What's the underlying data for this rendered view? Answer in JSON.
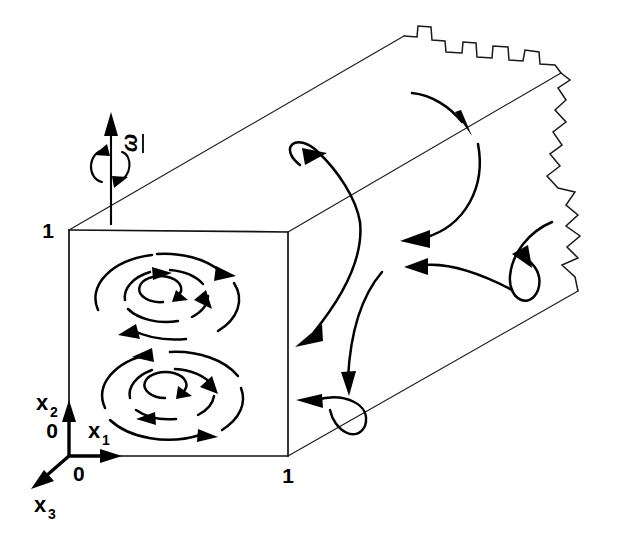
{
  "figure": {
    "kind": "technical-line-diagram",
    "background_color": "#ffffff",
    "line_color": "#000000"
  },
  "labels": {
    "corner_top_left": "1",
    "corner_bottom_right": "1",
    "origin_vertical": "0",
    "origin_horizontal": "0",
    "axis_x1": "x",
    "axis_x1_sub": "1",
    "axis_x2": "x",
    "axis_x2_sub": "2",
    "axis_x3": "x",
    "axis_x3_sub": "3",
    "rotation_vector": "ω"
  },
  "axes": {
    "x1": {
      "name": "x1",
      "direction": "right",
      "origin_label": "0",
      "extent_label": "1"
    },
    "x2": {
      "name": "x2",
      "direction": "up",
      "origin_label": "0",
      "extent_label": "1"
    },
    "x3": {
      "name": "x3",
      "direction": "into-page-lower-left",
      "origin_label": "0"
    }
  },
  "rotation": {
    "symbol": "ω",
    "underlined": true,
    "orientation": "vertical-rotated",
    "sense": "counter-clockwise-about-x2",
    "arrow_direction": "up"
  },
  "duct": {
    "shape": "square-cross-section",
    "projection": "oblique",
    "cross_section_side_label": "1",
    "cut_off_with_break_lines": true,
    "break_line_style": "jagged-step"
  },
  "vortices": [
    {
      "name": "upper-vortex",
      "center_x": 165,
      "center_y": 295,
      "sense": "clockwise",
      "ring_count": 3
    },
    {
      "name": "lower-vortex",
      "center_x": 172,
      "center_y": 393,
      "sense": "counter-clockwise",
      "ring_count": 3
    }
  ],
  "streamline_count": 8
}
